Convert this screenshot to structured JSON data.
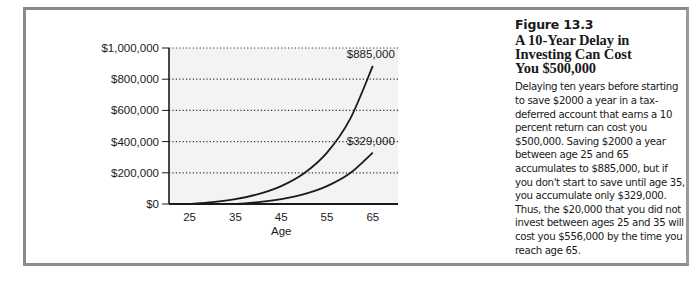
{
  "figure": {
    "number": "Figure 13.3",
    "title_lines": [
      "A 10-Year Delay in",
      "Investing Can Cost",
      "You $500,000"
    ],
    "body": "Delaying ten years before starting to save $2000 a year in a tax-deferred account that earns a 10 percent return can cost you $500,000. Saving $2000 a year between age 25 and 65 accumulates to $885,000, but if you don't start to save until age 35, you accumulate only $329,000. Thus, the $20,000 that you did not invest between ages 25 and 35 will cost you $556,000 by the time you reach age 65."
  },
  "chart_data": {
    "type": "line",
    "title": "A 10-Year Delay in Investing Can Cost You $500,000",
    "xlabel": "Age",
    "ylabel": "",
    "x_ticks": [
      25,
      35,
      45,
      55,
      65
    ],
    "y_ticks": [
      0,
      200000,
      400000,
      600000,
      800000,
      1000000
    ],
    "y_tick_labels": [
      "$0",
      "$200,000",
      "$400,000",
      "$600,000",
      "$800,000",
      "$1,000,000"
    ],
    "xlim": [
      20.5,
      70.5
    ],
    "ylim": [
      0,
      1000000
    ],
    "grid": "horizontal dotted",
    "legend": "none",
    "series": [
      {
        "name": "Start saving at age 25",
        "x": [
          25,
          30,
          35,
          40,
          45,
          50,
          55,
          60,
          65
        ],
        "values": [
          0,
          12210,
          31875,
          63549,
          114550,
          196694,
          329000,
          541994,
          885000
        ],
        "end_label": "$885,000"
      },
      {
        "name": "Start saving at age 35",
        "x": [
          35,
          40,
          45,
          50,
          55,
          60,
          65
        ],
        "values": [
          0,
          12210,
          31875,
          63549,
          114550,
          196694,
          329000
        ],
        "end_label": "$329,000"
      }
    ],
    "annotations": [
      "$885,000",
      "$329,000"
    ]
  },
  "colors": {
    "frame": "#8a8a8a",
    "plot_bg": "#f3f3f3",
    "line": "#1a1a1a",
    "grid": "#333333"
  }
}
